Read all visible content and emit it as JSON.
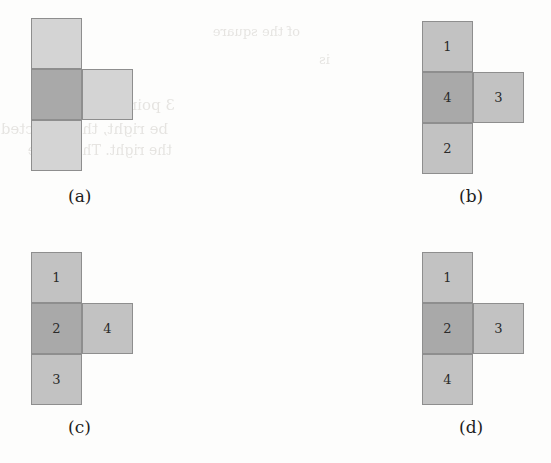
{
  "figure": {
    "caption_style": "(letter)",
    "background_color": "#fdfdfc",
    "colors": {
      "light_fill": "#d4d4d4",
      "light_fill_alt": "#c2c2c2",
      "dark_fill": "#a9a9a9",
      "stroke": "#8e8e8e",
      "label_text": "#1d1d1d",
      "bleed_text": "#d8d6d2"
    },
    "geometry": {
      "cell_size_px": 51,
      "note": "each panel is a T-shaped tetromino: vertical column of three cells plus one cell right of the middle cell"
    },
    "panels": [
      {
        "id": "a",
        "label": "(a)",
        "numbered": false,
        "cells": [
          {
            "position": "top",
            "shade": "light",
            "label": ""
          },
          {
            "position": "middle",
            "shade": "dark",
            "label": ""
          },
          {
            "position": "right",
            "shade": "light",
            "label": ""
          },
          {
            "position": "bottom",
            "shade": "light",
            "label": ""
          }
        ]
      },
      {
        "id": "b",
        "label": "(b)",
        "numbered": true,
        "cells": [
          {
            "position": "top",
            "shade": "light2",
            "label": "1"
          },
          {
            "position": "middle",
            "shade": "dark",
            "label": "4"
          },
          {
            "position": "right",
            "shade": "light2",
            "label": "3"
          },
          {
            "position": "bottom",
            "shade": "light2",
            "label": "2"
          }
        ]
      },
      {
        "id": "c",
        "label": "(c)",
        "numbered": true,
        "cells": [
          {
            "position": "top",
            "shade": "light2",
            "label": "1"
          },
          {
            "position": "middle",
            "shade": "dark",
            "label": "2"
          },
          {
            "position": "right",
            "shade": "light2",
            "label": "4"
          },
          {
            "position": "bottom",
            "shade": "light2",
            "label": "3"
          }
        ]
      },
      {
        "id": "d",
        "label": "(d)",
        "numbered": true,
        "cells": [
          {
            "position": "top",
            "shade": "light2",
            "label": "1"
          },
          {
            "position": "middle",
            "shade": "dark",
            "label": "2"
          },
          {
            "position": "right",
            "shade": "light2",
            "label": "3"
          },
          {
            "position": "bottom",
            "shade": "light2",
            "label": "4"
          }
        ]
      }
    ]
  },
  "bleed_through": {
    "description": "faint mirrored text showing through from the reverse side of the scanned page",
    "lines": [
      {
        "text": "of the square",
        "x": 300,
        "y": 24,
        "size": 13
      },
      {
        "text": "3 points",
        "x": 175,
        "y": 96,
        "size": 15
      },
      {
        "text": "be right, the reflected",
        "x": 168,
        "y": 120,
        "size": 15
      },
      {
        "text": "the right. The whole",
        "x": 172,
        "y": 142,
        "size": 14
      },
      {
        "text": "is",
        "x": 330,
        "y": 52,
        "size": 13
      }
    ]
  }
}
